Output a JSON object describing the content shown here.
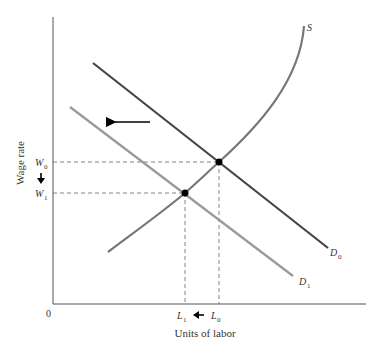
{
  "diagram": {
    "type": "labor-market-supply-demand",
    "y_axis": {
      "label": "Wage rate",
      "origin_label": "0"
    },
    "x_axis": {
      "label": "Units of labor"
    },
    "curves": {
      "supply": {
        "label": "S",
        "color": "#777777"
      },
      "demand_initial": {
        "label": "D",
        "subscript": "0",
        "color": "#444444"
      },
      "demand_new": {
        "label": "D",
        "subscript": "1",
        "color": "#999999"
      }
    },
    "wage_levels": [
      {
        "label": "W",
        "subscript": "0"
      },
      {
        "label": "W",
        "subscript": "1"
      }
    ],
    "labor_levels": [
      {
        "label": "L",
        "subscript": "1"
      },
      {
        "label": "L",
        "subscript": "0"
      }
    ],
    "annotations": {
      "demand_shift_arrow": "left",
      "wage_change_arrow": "down",
      "labor_change_arrow": "left"
    },
    "colors": {
      "axis": "#555555",
      "guide": "#666666",
      "point": "#000000",
      "arrow": "#000000"
    }
  }
}
